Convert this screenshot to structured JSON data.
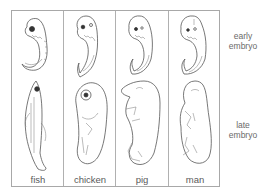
{
  "figure": {
    "columns": [
      {
        "id": "fish",
        "label": "fish"
      },
      {
        "id": "chicken",
        "label": "chicken"
      },
      {
        "id": "pig",
        "label": "pig"
      },
      {
        "id": "man",
        "label": "man"
      }
    ],
    "rows": [
      {
        "id": "early",
        "label_line1": "early",
        "label_line2": "embryo"
      },
      {
        "id": "late",
        "label_line1": "late",
        "label_line2": "embryo"
      }
    ],
    "colors": {
      "line": "#555555",
      "border": "#a8a8a8",
      "text": "#5a5a5a",
      "background": "#ffffff"
    }
  }
}
